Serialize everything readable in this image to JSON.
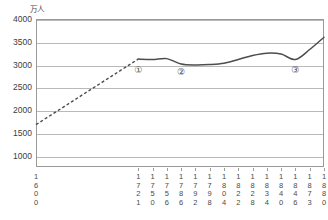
{
  "chart_data": {
    "type": "line",
    "title": "",
    "subtitle": "",
    "xlabel": "",
    "ylabel": "",
    "unit_label": "万人",
    "grid": true,
    "legend": "none",
    "xlim": [
      1600,
      1880
    ],
    "ylim": [
      750,
      4000
    ],
    "ytick_values": [
      1000,
      1500,
      2000,
      2500,
      3000,
      3500,
      4000
    ],
    "ytick_labels": [
      "1000",
      "1500",
      "2000",
      "2500",
      "3000",
      "3500",
      "4000"
    ],
    "categories": [
      "1600",
      "1721",
      "1750",
      "1756",
      "1786",
      "1792",
      "1798",
      "1804",
      "1822",
      "1828",
      "1834",
      "1840",
      "1846",
      "1873",
      "1880"
    ],
    "xtick_labels": [
      [
        "1",
        "6",
        "0",
        "0"
      ],
      [
        "1",
        "7",
        "2",
        "1"
      ],
      [
        "1",
        "7",
        "5",
        "0"
      ],
      [
        "1",
        "7",
        "5",
        "6"
      ],
      [
        "1",
        "7",
        "8",
        "6"
      ],
      [
        "1",
        "7",
        "9",
        "2"
      ],
      [
        "1",
        "7",
        "9",
        "8"
      ],
      [
        "1",
        "8",
        "0",
        "4"
      ],
      [
        "1",
        "8",
        "2",
        "2"
      ],
      [
        "1",
        "8",
        "2",
        "8"
      ],
      [
        "1",
        "8",
        "3",
        "4"
      ],
      [
        "1",
        "8",
        "4",
        "0"
      ],
      [
        "1",
        "8",
        "4",
        "6"
      ],
      [
        "1",
        "8",
        "7",
        "3"
      ],
      [
        "1",
        "8",
        "8",
        "0"
      ]
    ],
    "values": [
      1680,
      3120,
      3110,
      3130,
      3010,
      2990,
      3000,
      3030,
      3110,
      3200,
      3250,
      3230,
      3110,
      3330,
      3600
    ],
    "series": [
      {
        "name": "人口",
        "values": [
          1680,
          3120,
          3110,
          3130,
          3010,
          2990,
          3000,
          3030,
          3110,
          3200,
          3250,
          3230,
          3110,
          3330,
          3600
        ],
        "color": "#4d4d4d",
        "dashed_to_index": 1
      }
    ],
    "annotations": [
      {
        "label": "①",
        "x": "1721",
        "y": 2890
      },
      {
        "label": "②",
        "x": "1786",
        "y": 2840
      },
      {
        "label": "③",
        "x": "1846",
        "y": 2890
      }
    ],
    "colors": {
      "line": "#4d4d4d",
      "grid": "#b9b9b9",
      "axis": "#9a9a9a",
      "text": "#3d3d3d",
      "background": "#ffffff"
    }
  }
}
